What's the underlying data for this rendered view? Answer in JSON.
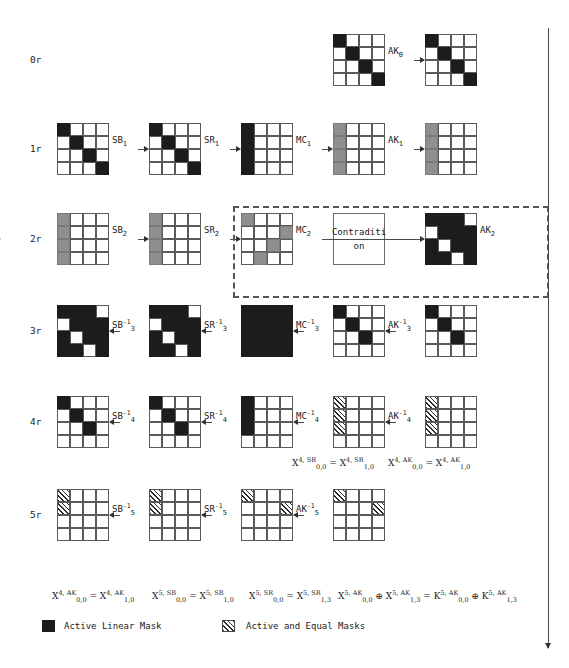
{
  "figure": {
    "legend": [
      {
        "swatch": "black",
        "label": "Active Linear Mask"
      },
      {
        "swatch": "hatch",
        "label": "Active and Equal Masks"
      }
    ],
    "contradiction_box": {
      "line1": "Contraditi",
      "line2": "on"
    }
  },
  "rows": [
    {
      "id": "row0",
      "label": "0r",
      "ops": [
        "AK<sub>0</sub>"
      ],
      "grids": [
        {
          "name": "state-0r-a",
          "cells": [
            "black",
            "white",
            "white",
            "white",
            "white",
            "black",
            "white",
            "white",
            "white",
            "white",
            "black",
            "white",
            "white",
            "white",
            "white",
            "black"
          ]
        },
        {
          "name": "state-0r-b",
          "cells": [
            "black",
            "white",
            "white",
            "white",
            "white",
            "black",
            "white",
            "white",
            "white",
            "white",
            "black",
            "white",
            "white",
            "white",
            "white",
            "black"
          ]
        }
      ]
    },
    {
      "id": "row1",
      "label": "1r",
      "ops": [
        "SB<sub>1</sub>",
        "SR<sub>1</sub>",
        "MC<sub>1</sub>",
        "AK<sub>1</sub>"
      ],
      "grids": [
        {
          "name": "state-1r-a",
          "cells": [
            "black",
            "white",
            "white",
            "white",
            "white",
            "black",
            "white",
            "white",
            "white",
            "white",
            "black",
            "white",
            "white",
            "white",
            "white",
            "black"
          ]
        },
        {
          "name": "state-1r-b",
          "cells": [
            "black",
            "white",
            "white",
            "white",
            "white",
            "black",
            "white",
            "white",
            "white",
            "white",
            "black",
            "white",
            "white",
            "white",
            "white",
            "black"
          ]
        },
        {
          "name": "state-1r-c",
          "cells": [
            "black",
            "white",
            "white",
            "white",
            "black",
            "white",
            "white",
            "white",
            "black",
            "white",
            "white",
            "white",
            "black",
            "white",
            "white",
            "white"
          ]
        },
        {
          "name": "state-1r-d",
          "cells": [
            "gray",
            "white",
            "white",
            "white",
            "gray",
            "white",
            "white",
            "white",
            "gray",
            "white",
            "white",
            "white",
            "gray",
            "white",
            "white",
            "white"
          ]
        },
        {
          "name": "state-1r-e",
          "cells": [
            "gray",
            "white",
            "white",
            "white",
            "gray",
            "white",
            "white",
            "white",
            "gray",
            "white",
            "white",
            "white",
            "gray",
            "white",
            "white",
            "white"
          ]
        }
      ]
    },
    {
      "id": "row2",
      "label": "2r",
      "ops": [
        "SB<sub>2</sub>",
        "SR<sub>2</sub>",
        "MC<sub>2</sub>",
        "AK<sub>2</sub>"
      ],
      "grids": [
        {
          "name": "state-2r-a",
          "cells": [
            "gray",
            "white",
            "white",
            "white",
            "gray",
            "white",
            "white",
            "white",
            "gray",
            "white",
            "white",
            "white",
            "gray",
            "white",
            "white",
            "white"
          ]
        },
        {
          "name": "state-2r-b",
          "cells": [
            "gray",
            "white",
            "white",
            "white",
            "gray",
            "white",
            "white",
            "white",
            "gray",
            "white",
            "white",
            "white",
            "gray",
            "white",
            "white",
            "white"
          ]
        },
        {
          "name": "state-2r-c",
          "cells": [
            "gray",
            "white",
            "white",
            "white",
            "white",
            "white",
            "white",
            "gray",
            "white",
            "white",
            "gray",
            "white",
            "white",
            "gray",
            "white",
            "white"
          ]
        },
        {
          "name": "state-2r-d",
          "cells": [
            "black",
            "black",
            "black",
            "white",
            "white",
            "black",
            "black",
            "black",
            "black",
            "white",
            "black",
            "black",
            "black",
            "black",
            "white",
            "black"
          ]
        }
      ]
    },
    {
      "id": "row3",
      "label": "3r",
      "ops": [
        "SB<sup>-1</sup><sub>3</sub>",
        "SR<sup>-1</sup><sub>3</sub>",
        "MC<sup>-1</sup><sub>3</sub>",
        "AK<sup>-1</sup><sub>3</sub>"
      ],
      "grids": [
        {
          "name": "state-3r-a",
          "cells": [
            "black",
            "black",
            "black",
            "white",
            "white",
            "black",
            "black",
            "black",
            "black",
            "white",
            "black",
            "black",
            "black",
            "black",
            "white",
            "black"
          ]
        },
        {
          "name": "state-3r-b",
          "cells": [
            "black",
            "black",
            "black",
            "white",
            "white",
            "black",
            "black",
            "black",
            "black",
            "white",
            "black",
            "black",
            "black",
            "black",
            "white",
            "black"
          ]
        },
        {
          "name": "state-3r-c",
          "cells": [
            "black",
            "black",
            "black",
            "black",
            "black",
            "black",
            "black",
            "black",
            "black",
            "black",
            "black",
            "black",
            "black",
            "black",
            "black",
            "black"
          ]
        },
        {
          "name": "state-3r-d",
          "cells": [
            "black",
            "white",
            "white",
            "white",
            "white",
            "black",
            "white",
            "white",
            "white",
            "white",
            "black",
            "white",
            "white",
            "white",
            "white",
            "white"
          ]
        },
        {
          "name": "state-3r-e",
          "cells": [
            "black",
            "white",
            "white",
            "white",
            "white",
            "black",
            "white",
            "white",
            "white",
            "white",
            "black",
            "white",
            "white",
            "white",
            "white",
            "white"
          ]
        }
      ]
    },
    {
      "id": "row4",
      "label": "4r",
      "ops": [
        "SB<sup>-1</sup><sub>4</sub>",
        "SR<sup>-1</sup><sub>4</sub>",
        "MC<sup>-1</sup><sub>4</sub>",
        "AK<sup>-1</sup><sub>4</sub>"
      ],
      "grids": [
        {
          "name": "state-4r-a",
          "cells": [
            "black",
            "white",
            "white",
            "white",
            "white",
            "black",
            "white",
            "white",
            "white",
            "white",
            "black",
            "white",
            "white",
            "white",
            "white",
            "white"
          ]
        },
        {
          "name": "state-4r-b",
          "cells": [
            "black",
            "white",
            "white",
            "white",
            "white",
            "black",
            "white",
            "white",
            "white",
            "white",
            "black",
            "white",
            "white",
            "white",
            "white",
            "white"
          ]
        },
        {
          "name": "state-4r-c",
          "cells": [
            "black",
            "white",
            "white",
            "white",
            "black",
            "white",
            "white",
            "white",
            "black",
            "white",
            "white",
            "white",
            "white",
            "white",
            "white",
            "white"
          ]
        },
        {
          "name": "state-4r-d",
          "cells": [
            "hatch",
            "white",
            "white",
            "white",
            "hatch",
            "white",
            "white",
            "white",
            "hatch",
            "white",
            "white",
            "white",
            "white",
            "white",
            "white",
            "white"
          ]
        },
        {
          "name": "state-4r-e",
          "cells": [
            "hatch",
            "white",
            "white",
            "white",
            "hatch",
            "white",
            "white",
            "white",
            "hatch",
            "white",
            "white",
            "white",
            "white",
            "white",
            "white",
            "white"
          ]
        }
      ]
    },
    {
      "id": "row5",
      "label": "5r",
      "ops": [
        "SB<sup>-1</sup><sub>5</sub>",
        "SR<sup>-1</sup><sub>5</sub>",
        "AK<sup>-1</sup><sub>5</sub>"
      ],
      "grids": [
        {
          "name": "state-5r-a",
          "cells": [
            "hatch",
            "white",
            "white",
            "white",
            "hatch",
            "white",
            "white",
            "white",
            "white",
            "white",
            "white",
            "white",
            "white",
            "white",
            "white",
            "white"
          ]
        },
        {
          "name": "state-5r-b",
          "cells": [
            "hatch",
            "white",
            "white",
            "white",
            "hatch",
            "white",
            "white",
            "white",
            "white",
            "white",
            "white",
            "white",
            "white",
            "white",
            "white",
            "white"
          ]
        },
        {
          "name": "state-5r-c",
          "cells": [
            "hatch",
            "white",
            "white",
            "white",
            "white",
            "white",
            "white",
            "hatch",
            "white",
            "white",
            "white",
            "white",
            "white",
            "white",
            "white",
            "white"
          ]
        },
        {
          "name": "state-5r-d",
          "cells": [
            "hatch",
            "white",
            "white",
            "white",
            "white",
            "white",
            "white",
            "hatch",
            "white",
            "white",
            "white",
            "white",
            "white",
            "white",
            "white",
            "white"
          ]
        }
      ]
    }
  ],
  "formulas": {
    "mid_row4_left": "X<sup>4, SR</sup><sub>0,0</sub> = X<sup>4, SR</sup><sub>1,0</sub>",
    "mid_row4_right": "X<sup>4, AK</sup><sub>0,0</sub> = X<sup>4, AK</sup><sub>1,0</sub>",
    "bottom_1": "X<sup>4, AK</sup><sub>0,0</sub> = X<sup>4, AK</sup><sub>1,0</sub>",
    "bottom_2": "X<sup>5, SB</sup><sub>0,0</sub> = X<sup>5, SB</sup><sub>1,0</sub>",
    "bottom_3": "X<sup>5, SR</sup><sub>0,0</sub> = X<sup>5, SR</sup><sub>1,3</sub>",
    "bottom_4": "X<sup>5, AK</sup><sub>0,0</sub> &#8853; X<sup>5, AK</sup><sub>1,3</sub> =  K<sup>5, AK</sup><sub>0,0</sub> &#8853; K<sup>5, AK</sup><sub>1,3</sub>"
  },
  "colors": {
    "active_mask": "#1c1c1c",
    "gray_mask": "#8f8f8f",
    "grid_line": "#5a5a5a",
    "arrow": "#4a4a4a",
    "dashed_border": "#555555"
  }
}
